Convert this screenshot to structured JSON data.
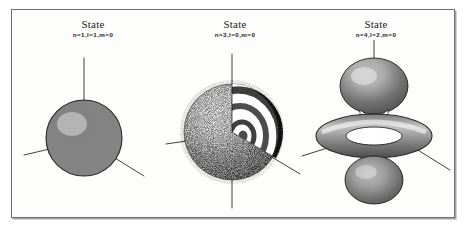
{
  "figure": {
    "background_color": "#fdfdfb",
    "border_color": "#6f6f72",
    "ink_color": "#1b1b1f"
  },
  "panels": [
    {
      "id": "panel-1s",
      "state_label": "State",
      "quantum_numbers": "n=1,l=1,m=0",
      "n": 1,
      "l": 1,
      "m": 0,
      "shape": "sphere",
      "description": "solid stippled sphere with three coordinate axes"
    },
    {
      "id": "panel-3s",
      "state_label": "State",
      "quantum_numbers": "n=3,l=0,m=0",
      "n": 3,
      "l": 0,
      "m": 0,
      "shape": "cutaway-sphere-with-shells",
      "description": "sphere cut open revealing concentric radial node shells"
    },
    {
      "id": "panel-4d",
      "state_label": "State",
      "quantum_numbers": "n=4,l=2,m=0",
      "n": 4,
      "l": 2,
      "m": 0,
      "shape": "dz2-lobes-with-torus",
      "description": "two vertical lobes with an equatorial torus ring"
    }
  ]
}
